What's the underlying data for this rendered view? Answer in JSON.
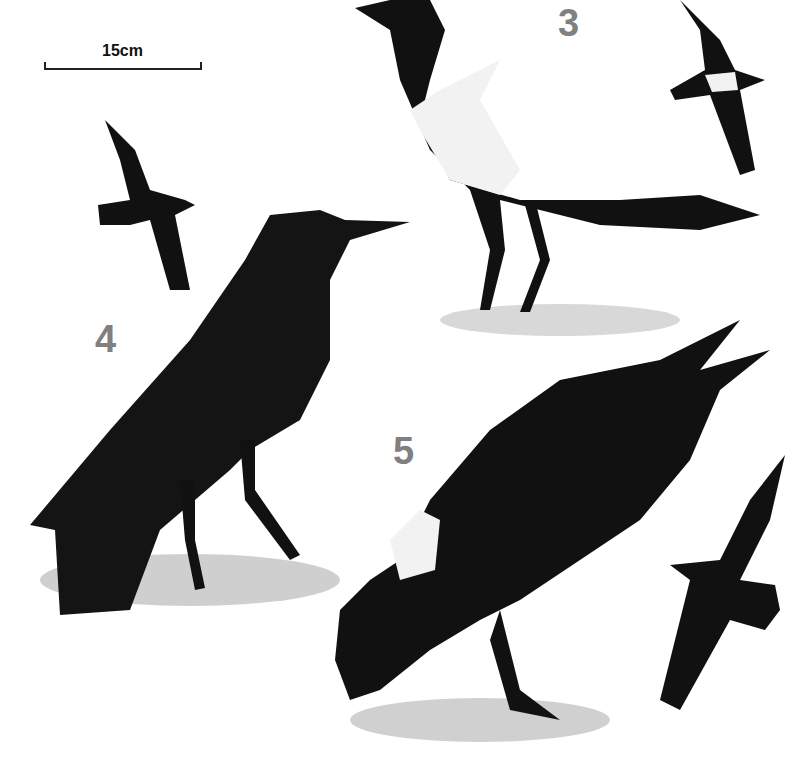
{
  "scale_bar": {
    "label": "15cm"
  },
  "species_numbers": [
    {
      "label": "3",
      "x": 558,
      "y": 2
    },
    {
      "label": "4",
      "x": 95,
      "y": 318
    },
    {
      "label": "5",
      "x": 393,
      "y": 430
    }
  ],
  "colors": {
    "plumage": "#111111",
    "white_patch": "#f2f2f2",
    "ground": "#cfcfcf",
    "numbers": "#808080"
  }
}
